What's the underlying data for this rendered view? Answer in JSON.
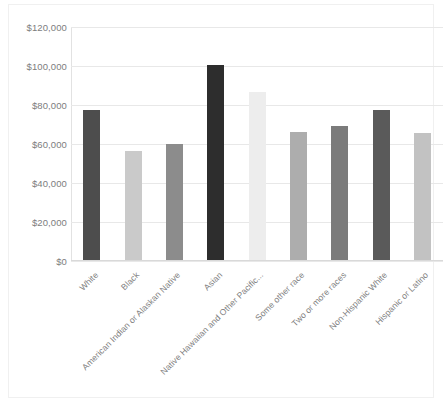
{
  "chart_data": {
    "type": "bar",
    "title": "",
    "xlabel": "",
    "ylabel": "",
    "categories": [
      "White",
      "Black",
      "American Indian or Alaskan Native",
      "Asian",
      "Native Hawaiian and Other Pacific...",
      "Some other race",
      "Two or more races",
      "Non-Hispanic White",
      "Hispanic or Latino"
    ],
    "values": [
      77000,
      56000,
      59500,
      100000,
      86000,
      65500,
      68500,
      77000,
      65000
    ],
    "bar_colors": [
      "#4d4d4d",
      "#cacaca",
      "#8c8c8c",
      "#2d2d2d",
      "#ededed",
      "#adadad",
      "#7b7b7b",
      "#5a5a5a",
      "#c2c2c2"
    ],
    "ylim": [
      0,
      120000
    ],
    "ytick_values": [
      0,
      20000,
      40000,
      60000,
      80000,
      100000,
      120000
    ],
    "ytick_labels": [
      "$0",
      "$20,000",
      "$40,000",
      "$60,000",
      "$80,000",
      "$100,000",
      "$120,000"
    ],
    "grid": true,
    "legend": false,
    "gridline_color": "#e8e8e8",
    "axis_label_color": "#7d7d7d"
  }
}
